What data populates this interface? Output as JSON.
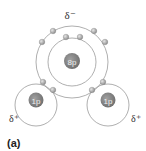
{
  "diagram": {
    "oxygen": {
      "nucleus_label": "8p",
      "charge_label": "δ⁻"
    },
    "hydrogens": [
      {
        "nucleus_label": "1p",
        "charge_label": "δ⁺"
      },
      {
        "nucleus_label": "1p",
        "charge_label": "δ⁺"
      }
    ],
    "caption": "(a)",
    "colors": {
      "shell": "#9a9a9a",
      "nucleus": "#7d7d7d",
      "electron": "#a8a8a8"
    }
  }
}
